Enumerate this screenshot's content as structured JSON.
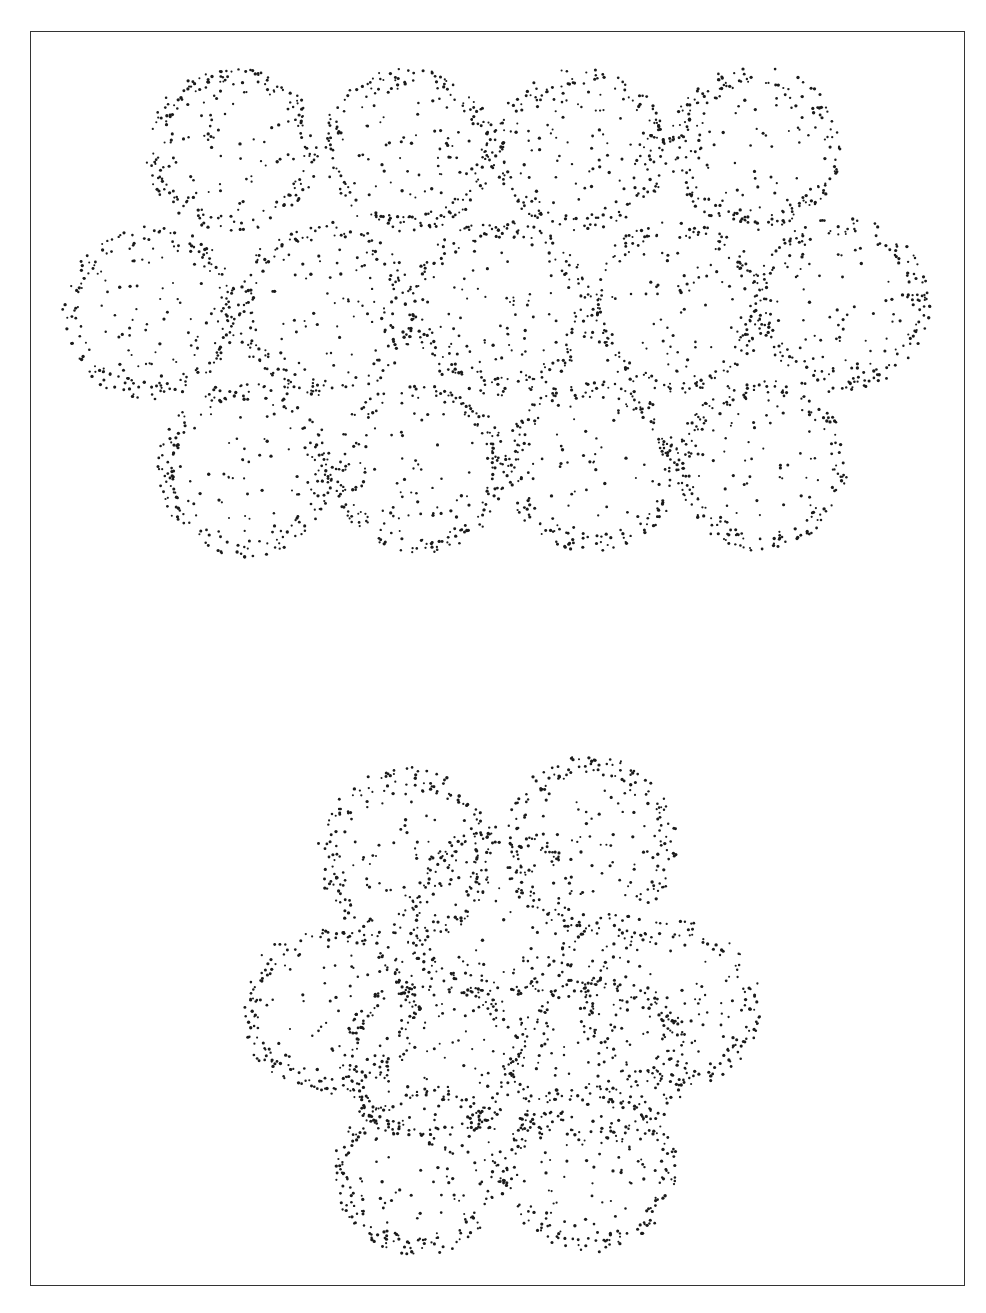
{
  "figure": {
    "frame": {
      "x": 30,
      "y": 31,
      "width": 935,
      "height": 1255,
      "stroke": "#333333"
    },
    "dot_color": "#1a1a1a",
    "clusters": [
      {
        "name": "planar-array-cluster",
        "spheres": [
          {
            "cx": 232,
            "cy": 150,
            "rx": 88,
            "ry": 82
          },
          {
            "cx": 408,
            "cy": 150,
            "rx": 88,
            "ry": 82
          },
          {
            "cx": 580,
            "cy": 150,
            "rx": 88,
            "ry": 82
          },
          {
            "cx": 755,
            "cy": 148,
            "rx": 86,
            "ry": 82
          },
          {
            "cx": 150,
            "cy": 312,
            "rx": 88,
            "ry": 88
          },
          {
            "cx": 325,
            "cy": 310,
            "rx": 90,
            "ry": 88
          },
          {
            "cx": 500,
            "cy": 308,
            "rx": 90,
            "ry": 88
          },
          {
            "cx": 675,
            "cy": 308,
            "rx": 90,
            "ry": 88
          },
          {
            "cx": 842,
            "cy": 305,
            "rx": 88,
            "ry": 88
          },
          {
            "cx": 245,
            "cy": 470,
            "rx": 88,
            "ry": 88
          },
          {
            "cx": 420,
            "cy": 468,
            "rx": 88,
            "ry": 86
          },
          {
            "cx": 592,
            "cy": 466,
            "rx": 88,
            "ry": 86
          },
          {
            "cx": 762,
            "cy": 465,
            "rx": 86,
            "ry": 86
          }
        ]
      },
      {
        "name": "close-packed-cluster",
        "spheres": [
          {
            "cx": 405,
            "cy": 855,
            "rx": 88,
            "ry": 88
          },
          {
            "cx": 590,
            "cy": 845,
            "rx": 88,
            "ry": 90
          },
          {
            "cx": 495,
            "cy": 915,
            "rx": 92,
            "ry": 90
          },
          {
            "cx": 330,
            "cy": 1010,
            "rx": 90,
            "ry": 85
          },
          {
            "cx": 670,
            "cy": 1005,
            "rx": 92,
            "ry": 85
          },
          {
            "cx": 430,
            "cy": 1060,
            "rx": 92,
            "ry": 85
          },
          {
            "cx": 600,
            "cy": 1060,
            "rx": 92,
            "ry": 85
          },
          {
            "cx": 420,
            "cy": 1170,
            "rx": 88,
            "ry": 85
          },
          {
            "cx": 590,
            "cy": 1168,
            "rx": 88,
            "ry": 85
          }
        ]
      }
    ]
  }
}
